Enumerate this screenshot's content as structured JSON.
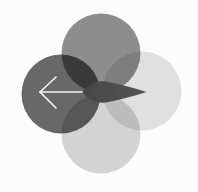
{
  "figure": {
    "canvas": {
      "width": 198,
      "height": 192
    },
    "background_color": "#fcfcfc",
    "blend_mode": "multiply",
    "edge_blur_px": 0.7,
    "circles": [
      {
        "name": "circle-top",
        "cx": 101,
        "cy": 53,
        "r": 39.5,
        "color": "#8f8f8f"
      },
      {
        "name": "circle-right",
        "cx": 142,
        "cy": 91,
        "r": 39.5,
        "color": "#e3e3e3"
      },
      {
        "name": "circle-bottom",
        "cx": 101,
        "cy": 134,
        "r": 39.5,
        "color": "#d6d6d6"
      },
      {
        "name": "circle-left",
        "cx": 61,
        "cy": 94,
        "r": 39.5,
        "color": "#696969"
      }
    ],
    "dart": {
      "name": "right-dart",
      "color": "#474747",
      "color_tip": "#545454",
      "path": "M 82,92 C 88,84.5 97,80 106,81.5 C 120,84 134,88.2 146.5,92 C 134,95.8 120,100 106,102.5 C 97,104 88,99.5 82,92 Z"
    },
    "left_arrow": {
      "name": "left-arrow",
      "color": "#f2f2f2",
      "stroke_width": 1.7,
      "shaft": {
        "x1": 40,
        "y1": 92,
        "x2": 82,
        "y2": 92
      },
      "head_upper": {
        "x1": 40,
        "y1": 92,
        "x2": 56,
        "y2": 77
      },
      "head_lower": {
        "x1": 40,
        "y1": 92,
        "x2": 56,
        "y2": 108
      }
    }
  }
}
